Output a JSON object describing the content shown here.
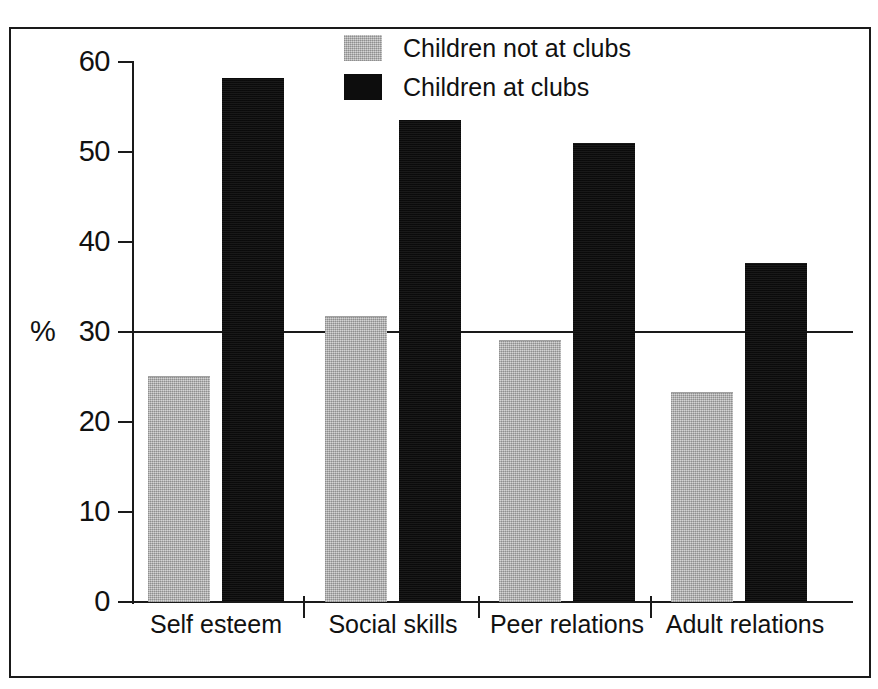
{
  "chart_data": {
    "type": "bar",
    "title": "",
    "subtitle": "",
    "xlabel": "",
    "ylabel": "%",
    "ylim": [
      0,
      60
    ],
    "yticks": [
      0,
      10,
      20,
      30,
      40,
      50,
      60
    ],
    "ytick_labels": [
      "0",
      "10",
      "20",
      "30",
      "40",
      "50",
      "60"
    ],
    "grid": false,
    "gridline_values": [
      30
    ],
    "legend_position": "top-center",
    "categories": [
      "Self esteem",
      "Social skills",
      "Peer relations",
      "Adult relations"
    ],
    "series": [
      {
        "name": "Children not at clubs",
        "color": "#bcbcbc",
        "values": [
          25.0,
          31.7,
          29.0,
          23.2
        ]
      },
      {
        "name": "Children at clubs",
        "color": "#0d0d0d",
        "values": [
          58.2,
          53.6,
          51.0,
          37.7
        ]
      }
    ]
  },
  "legend": {
    "items": [
      {
        "label": "Children not at clubs",
        "swatch": "light-grey-swatch"
      },
      {
        "label": "Children at clubs",
        "swatch": "black-swatch"
      }
    ]
  },
  "axis": {
    "y_title": "%",
    "y_labels": [
      "60",
      "50",
      "40",
      "30",
      "20",
      "10",
      "0"
    ],
    "x_labels": [
      "Self esteem",
      "Social skills",
      "Peer relations",
      "Adult relations"
    ]
  }
}
